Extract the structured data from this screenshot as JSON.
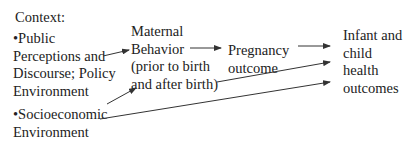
{
  "context_label": "Context:",
  "nodes": {
    "public": [
      "•Public",
      "Perceptions and",
      "Discourse; Policy",
      "Environment"
    ],
    "socio": [
      "•Socioeconomic",
      "Environment"
    ],
    "maternal": [
      "Maternal",
      "Behavior",
      "(prior to birth",
      "and after birth)"
    ],
    "pregnancy": [
      "Pregnancy",
      "outcome"
    ],
    "infant": [
      "Infant and",
      "child",
      "health",
      "outcomes"
    ]
  },
  "edges": [
    {
      "from": "public",
      "to": "maternal"
    },
    {
      "from": "socio",
      "to": "maternal"
    },
    {
      "from": "maternal",
      "to": "pregnancy"
    },
    {
      "from": "maternal",
      "to": "infant"
    },
    {
      "from": "pregnancy",
      "to": "infant"
    },
    {
      "from": "socio",
      "to": "infant"
    }
  ],
  "colors": {
    "line": "#333333",
    "text": "#222222"
  }
}
